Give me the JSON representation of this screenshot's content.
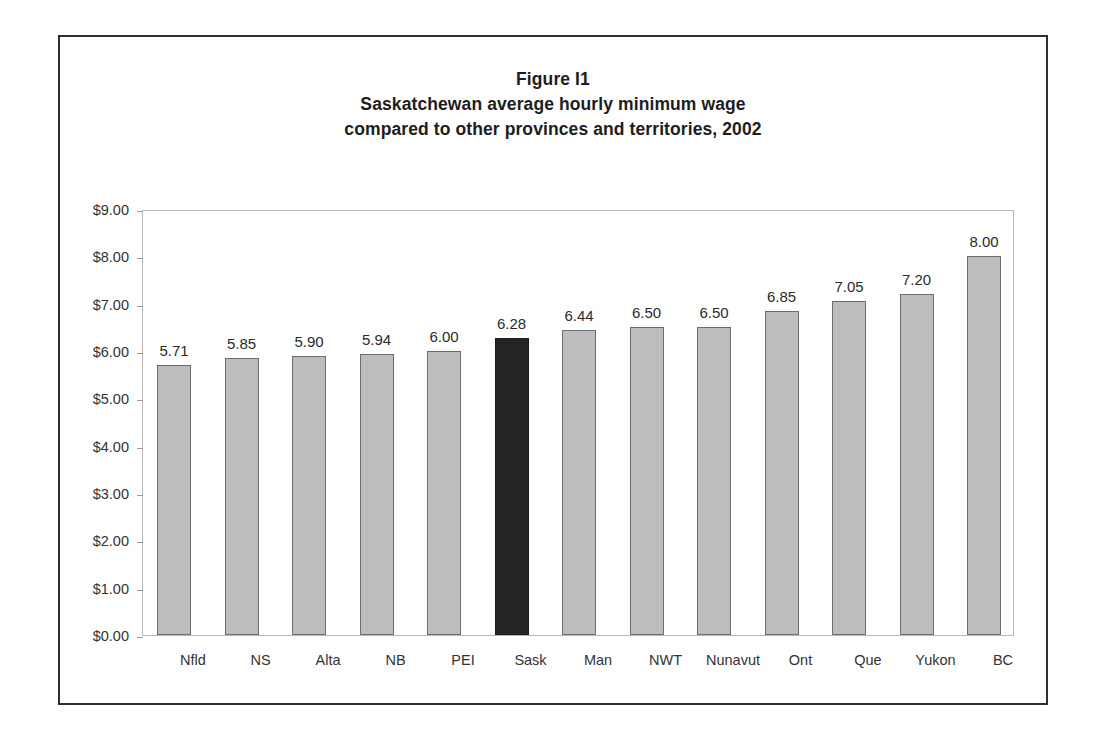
{
  "figure": {
    "title_lines": [
      "Figure I1",
      "Saskatchewan average hourly minimum wage",
      "compared to other provinces and territories, 2002"
    ],
    "frame_color": "#2f2f2f",
    "plot_border_color": "#b9b9b9"
  },
  "chart_data": {
    "type": "bar",
    "subtitle": "compared to other provinces and territories, 2002",
    "xlabel": "",
    "ylabel": "",
    "ylim": [
      0,
      9
    ],
    "ytick_step": 1,
    "ytick_labels": [
      "$9.00",
      "$8.00",
      "$7.00",
      "$6.00",
      "$5.00",
      "$4.00",
      "$3.00",
      "$2.00",
      "$1.00",
      "$0.00"
    ],
    "ytick_values": [
      9,
      8,
      7,
      6,
      5,
      4,
      3,
      2,
      1,
      0
    ],
    "grid": false,
    "legend": false,
    "categories": [
      "Nfld",
      "NS",
      "Alta",
      "NB",
      "PEI",
      "Sask",
      "Man",
      "NWT",
      "Nunavut",
      "Ont",
      "Que",
      "Yukon",
      "BC"
    ],
    "values": [
      5.71,
      5.85,
      5.9,
      5.94,
      6.0,
      6.28,
      6.44,
      6.5,
      6.5,
      6.85,
      7.05,
      7.2,
      8.0
    ],
    "value_labels": [
      "5.71",
      "5.85",
      "5.90",
      "5.94",
      "6.00",
      "6.28",
      "6.44",
      "6.50",
      "6.50",
      "6.85",
      "7.05",
      "7.20",
      "8.00"
    ],
    "highlight_category": "Sask",
    "highlight_index": 5,
    "bar_color": "#bdbdbd",
    "bar_border_color": "#6d6d6d",
    "highlight_color": "#242424",
    "highlight_border_color": "#1a1a1a"
  }
}
